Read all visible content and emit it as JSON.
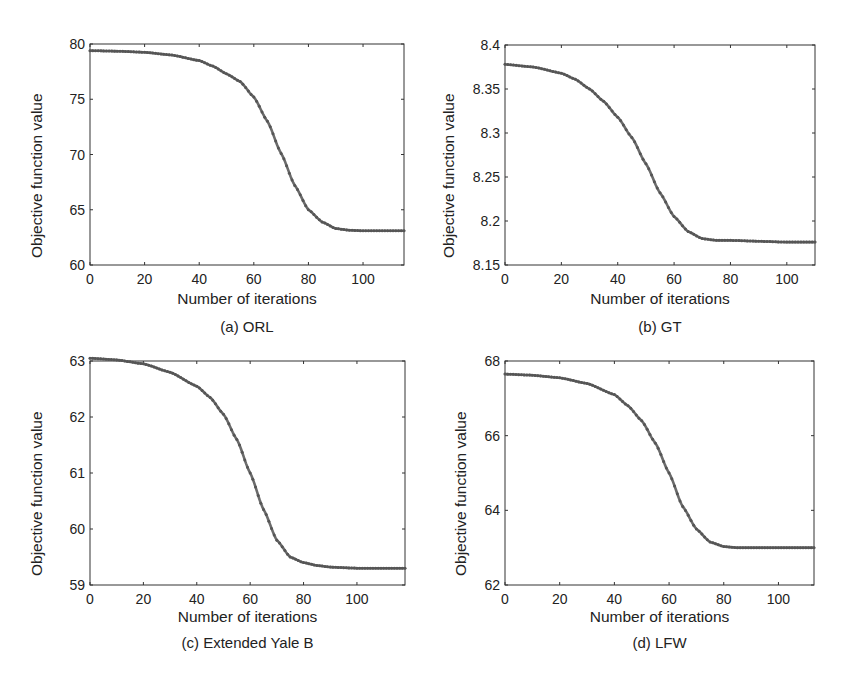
{
  "figure": {
    "panels": [
      {
        "id": "a",
        "caption": "(a) ORL",
        "xlabel": "Number of iterations",
        "ylabel": "Objective function value"
      },
      {
        "id": "b",
        "caption": "(b) GT",
        "xlabel": "Number of iterations",
        "ylabel": "Objective function value"
      },
      {
        "id": "c",
        "caption": "(c) Extended Yale B",
        "xlabel": "Number of iterations",
        "ylabel": "Objective function value"
      },
      {
        "id": "d",
        "caption": "(d) LFW",
        "xlabel": "Number of iterations",
        "ylabel": "Objective function value"
      }
    ],
    "line_color": "#6b6b6b",
    "axis_color": "#333333"
  },
  "chart_data": [
    {
      "type": "line",
      "title": "(a) ORL",
      "xlabel": "Number of iterations",
      "ylabel": "Objective function value",
      "xlim": [
        0,
        115
      ],
      "ylim": [
        60,
        80
      ],
      "xticks": [
        0,
        20,
        40,
        60,
        80,
        100
      ],
      "yticks": [
        60,
        65,
        70,
        75,
        80
      ],
      "grid": false,
      "marker": "dot",
      "series": [
        {
          "name": "ORL",
          "x": [
            0,
            10,
            20,
            30,
            40,
            45,
            50,
            55,
            60,
            65,
            70,
            75,
            80,
            85,
            90,
            95,
            100,
            105,
            110,
            115
          ],
          "y": [
            79.4,
            79.35,
            79.25,
            79.0,
            78.5,
            78.0,
            77.3,
            76.6,
            75.2,
            73.0,
            70.1,
            67.2,
            65.0,
            63.9,
            63.3,
            63.15,
            63.1,
            63.1,
            63.1,
            63.1
          ]
        }
      ]
    },
    {
      "type": "line",
      "title": "(b) GT",
      "xlabel": "Number of iterations",
      "ylabel": "Objective function value",
      "xlim": [
        0,
        110
      ],
      "ylim": [
        8.15,
        8.4
      ],
      "xticks": [
        0,
        20,
        40,
        60,
        80,
        100
      ],
      "yticks": [
        8.15,
        8.2,
        8.25,
        8.3,
        8.35,
        8.4
      ],
      "grid": false,
      "marker": "dot",
      "series": [
        {
          "name": "GT",
          "x": [
            0,
            10,
            20,
            25,
            30,
            35,
            40,
            45,
            50,
            55,
            60,
            65,
            70,
            75,
            80,
            90,
            100,
            110
          ],
          "y": [
            8.378,
            8.375,
            8.368,
            8.361,
            8.35,
            8.336,
            8.318,
            8.295,
            8.265,
            8.232,
            8.205,
            8.188,
            8.18,
            8.178,
            8.178,
            8.177,
            8.176,
            8.176
          ]
        }
      ]
    },
    {
      "type": "line",
      "title": "(c) Extended Yale B",
      "xlabel": "Number of iterations",
      "ylabel": "Objective function value",
      "xlim": [
        0,
        118
      ],
      "ylim": [
        59,
        63
      ],
      "xticks": [
        0,
        20,
        40,
        60,
        80,
        100
      ],
      "yticks": [
        59,
        60,
        61,
        62,
        63
      ],
      "grid": false,
      "marker": "dot",
      "series": [
        {
          "name": "Extended Yale B",
          "x": [
            0,
            10,
            20,
            30,
            40,
            45,
            50,
            55,
            60,
            65,
            70,
            75,
            80,
            85,
            90,
            100,
            110,
            118
          ],
          "y": [
            63.05,
            63.02,
            62.95,
            62.8,
            62.55,
            62.35,
            62.05,
            61.6,
            61.0,
            60.35,
            59.8,
            59.5,
            59.4,
            59.35,
            59.32,
            59.3,
            59.3,
            59.3
          ]
        }
      ]
    },
    {
      "type": "line",
      "title": "(d) LFW",
      "xlabel": "Number of iterations",
      "ylabel": "Objective function value",
      "xlim": [
        0,
        113
      ],
      "ylim": [
        62,
        68
      ],
      "xticks": [
        0,
        20,
        40,
        60,
        80,
        100
      ],
      "yticks": [
        62,
        64,
        66,
        68
      ],
      "grid": false,
      "marker": "dot",
      "series": [
        {
          "name": "LFW",
          "x": [
            0,
            10,
            20,
            30,
            40,
            45,
            50,
            55,
            60,
            65,
            70,
            75,
            80,
            85,
            90,
            100,
            113
          ],
          "y": [
            67.65,
            67.62,
            67.55,
            67.4,
            67.1,
            66.8,
            66.4,
            65.8,
            65.0,
            64.1,
            63.5,
            63.15,
            63.03,
            63.0,
            63.0,
            63.0,
            63.0
          ]
        }
      ]
    }
  ]
}
